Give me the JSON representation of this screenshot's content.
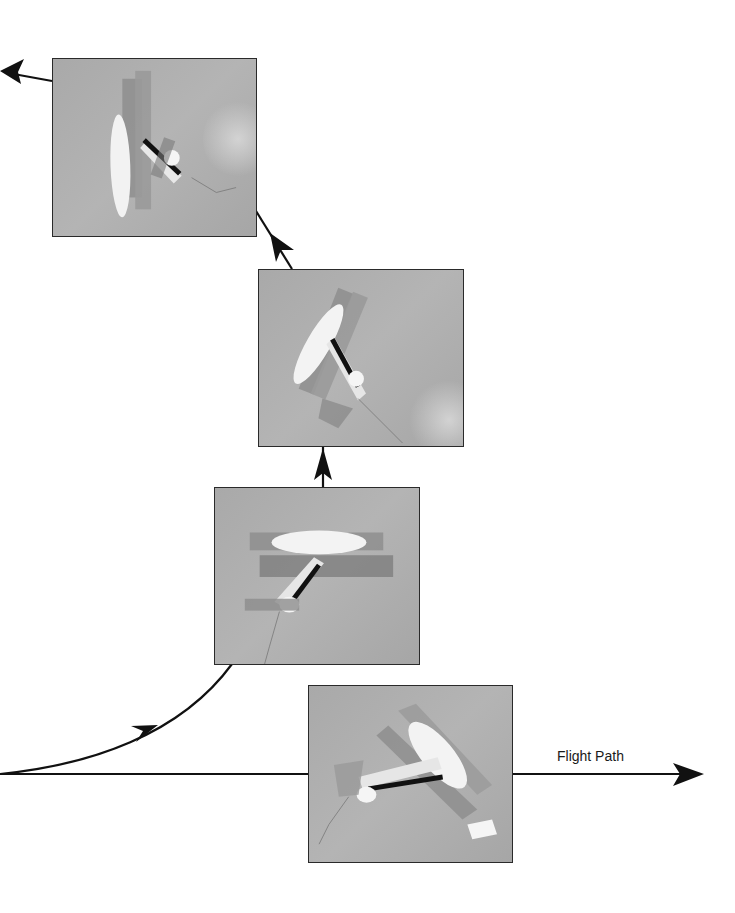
{
  "diagram": {
    "flight_path_label": "Flight Path",
    "photos": [
      {
        "id": "photo-1",
        "description": "Biplane pointing nose down, vertical attitude",
        "position": "top-left"
      },
      {
        "id": "photo-2",
        "description": "Biplane climbing, rotated diagonally",
        "position": "upper-middle"
      },
      {
        "id": "photo-3",
        "description": "Biplane pulling up, level wings",
        "position": "lower-middle"
      },
      {
        "id": "photo-4",
        "description": "Biplane in level flight toward the right",
        "position": "bottom-right"
      }
    ],
    "arrows": [
      {
        "id": "straight-flight-path",
        "from": "left edge",
        "to": "right (arrowhead at far right)"
      },
      {
        "id": "pull-up-curve",
        "from": "left origin",
        "to": "photo-3"
      },
      {
        "id": "photo3-to-photo2",
        "direction": "up"
      },
      {
        "id": "photo2-to-photo1",
        "direction": "up-left"
      },
      {
        "id": "photo1-exit",
        "direction": "left"
      }
    ],
    "colors": {
      "line": "#111111",
      "photo_sky": "#adadad",
      "photo_border": "#2a2a2a"
    }
  }
}
